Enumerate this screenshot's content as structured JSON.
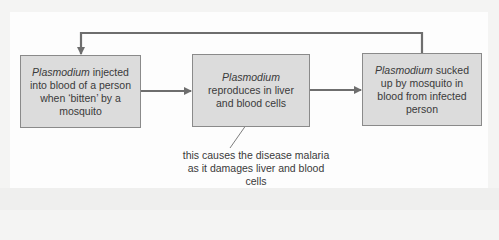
{
  "diagram": {
    "boxes": [
      {
        "italic": "Plasmodium",
        "text": " injected into blood of a person when ‘bitten’ by a mosquito"
      },
      {
        "italic": "Plasmodium",
        "text": " reproduces in liver and blood cells"
      },
      {
        "italic": "Plasmodium",
        "text": " sucked up by mosquito in blood from infected person"
      }
    ],
    "annotation": "this causes the disease malaria as it damages liver and blood cells",
    "colors": {
      "box_fill": "#dcdcdc",
      "box_border": "#8a8a8a",
      "arrow": "#6e6e6e",
      "text": "#3a3a3a"
    }
  }
}
